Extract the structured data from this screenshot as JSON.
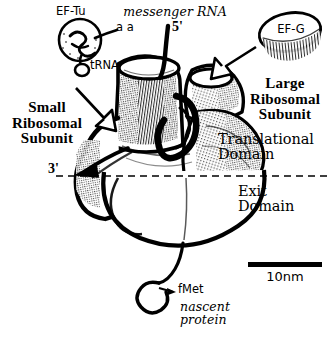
{
  "figure": {
    "name": "ribosome-translation-diagram",
    "background_color": "#ffffff",
    "ink_color": "#000000"
  },
  "labels": {
    "ef_tu": "EF-Tu",
    "amino_acid": "a a",
    "trna": "tRNA",
    "messenger_rna": "messenger RNA",
    "five_prime": "5'",
    "three_prime": "3'",
    "ef_g": "EF-G",
    "small_subunit": "Small\nRibosomal\nSubunit",
    "large_subunit": "Large\nRibosomal\nSubunit",
    "translational_domain": "Translational\nDomain",
    "exit_domain": "Exit\nDomain",
    "fmet": "fMet",
    "nascent_protein": "nascent\nprotein",
    "scale": "10nm"
  },
  "scale_bar": {
    "label": "10nm",
    "length_px": 74,
    "thickness_px": 5,
    "represents": "10nm"
  },
  "divider": {
    "name": "domain-divider",
    "style": "dashed",
    "y_px": 176
  }
}
